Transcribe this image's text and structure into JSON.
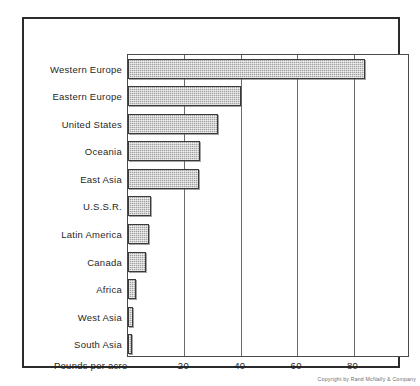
{
  "chart_data": {
    "type": "bar",
    "orientation": "horizontal",
    "title": "",
    "xlabel": "Pounds per acre",
    "ylabel": "",
    "xlim": [
      0,
      100
    ],
    "grid": true,
    "legend": false,
    "xticks": [
      20,
      40,
      60,
      80
    ],
    "xtick_labels": [
      "20",
      "40",
      "60",
      "80"
    ],
    "categories": [
      "Western Europe",
      "Eastern Europe",
      "United States",
      "Oceania",
      "East Asia",
      "U.S.S.R.",
      "Latin America",
      "Canada",
      "Africa",
      "West Asia",
      "South Asia"
    ],
    "values": [
      84,
      40,
      32,
      25.5,
      25,
      8,
      7.5,
      6.5,
      2.8,
      1.7,
      1.3
    ],
    "bar_color": "#b3b3b3",
    "bar_edge_color": "#3a3a3a",
    "frame_color": "#2b2b2b",
    "background": "#ffffff"
  },
  "axis": {
    "title": "Pounds per acre",
    "ticks": [
      {
        "label": "20",
        "value": 20
      },
      {
        "label": "40",
        "value": 40
      },
      {
        "label": "60",
        "value": 60
      },
      {
        "label": "80",
        "value": 80
      }
    ]
  },
  "footer": {
    "copyright": "Copyright by Rand McNally & Company"
  }
}
